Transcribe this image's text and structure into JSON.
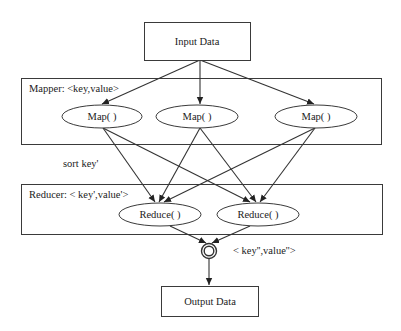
{
  "diagram": {
    "type": "mapreduce-flow",
    "nodes": {
      "input": {
        "label": "Input Data"
      },
      "map1": {
        "label": "Map( )"
      },
      "map2": {
        "label": "Map( )"
      },
      "map3": {
        "label": "Map( )"
      },
      "reduce1": {
        "label": "Reduce( )"
      },
      "reduce2": {
        "label": "Reduce( )"
      },
      "output": {
        "label": "Output Data"
      }
    },
    "groups": {
      "mapper": {
        "label": "Mapper: <key,value>"
      },
      "reducer": {
        "label": "Reducer: < key',value'>"
      }
    },
    "annotations": {
      "sort": "sort key'",
      "final": "< key'',value''>"
    },
    "edges": [
      {
        "from": "input",
        "to": "map1"
      },
      {
        "from": "input",
        "to": "map2"
      },
      {
        "from": "input",
        "to": "map3"
      },
      {
        "from": "map1",
        "to": "reduce1"
      },
      {
        "from": "map1",
        "to": "reduce2"
      },
      {
        "from": "map2",
        "to": "reduce1"
      },
      {
        "from": "map2",
        "to": "reduce2"
      },
      {
        "from": "map3",
        "to": "reduce1"
      },
      {
        "from": "map3",
        "to": "reduce2"
      },
      {
        "from": "reduce1",
        "to": "merge"
      },
      {
        "from": "reduce2",
        "to": "merge"
      },
      {
        "from": "merge",
        "to": "output"
      }
    ]
  }
}
